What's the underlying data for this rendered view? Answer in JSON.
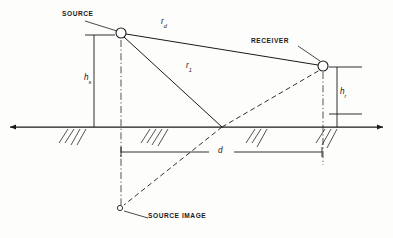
{
  "figure": {
    "name": "source-receiver-ground-reflection-geometry",
    "type": "technical-line-diagram",
    "background": "#fdfdfc",
    "line_color": "#1a1a1a"
  },
  "labels": {
    "source": "SOURCE",
    "receiver": "RECEIVER",
    "source_image": "SOURCE IMAGE",
    "direct_path": "r",
    "direct_path_sub": "d",
    "reflected_path": "r",
    "reflected_path_sub": "1",
    "source_height": "h",
    "source_height_sub": "s",
    "receiver_height": "h",
    "receiver_height_sub": "r",
    "separation": "d"
  },
  "geometry": {
    "source_point": {
      "x": 121,
      "y": 33,
      "radius": 5
    },
    "receiver_point": {
      "x": 323,
      "y": 66,
      "radius": 5
    },
    "source_image_point": {
      "x": 120,
      "y": 208,
      "radius": 2.6
    },
    "reflection_point": {
      "x": 222,
      "y": 127
    },
    "ground_line": {
      "x1": 10,
      "x2": 383,
      "y": 127
    },
    "hs_dimension": {
      "x": 94,
      "y_top": 35,
      "y_bottom": 127
    },
    "hr_dimension": {
      "x": 337,
      "y_top": 67,
      "y_bottom": 127
    },
    "d_dimension": {
      "y": 152,
      "x_left": 121,
      "x_right": 322
    }
  },
  "hatching": {
    "groups": [
      {
        "x": 68,
        "count": 4
      },
      {
        "x": 150,
        "count": 4
      },
      {
        "x": 255,
        "count": 3
      },
      {
        "x": 325,
        "count": 3
      }
    ]
  }
}
